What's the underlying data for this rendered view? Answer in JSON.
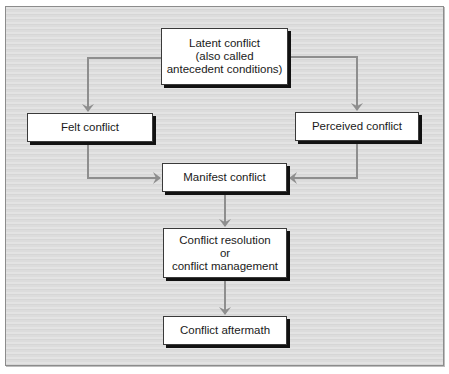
{
  "diagram": {
    "type": "flowchart",
    "nodes": {
      "latent": {
        "lines": [
          "Latent conflict",
          "(also called",
          "antecedent conditions)"
        ]
      },
      "felt": {
        "lines": [
          "Felt conflict"
        ]
      },
      "perceived": {
        "lines": [
          "Perceived conflict"
        ]
      },
      "manifest": {
        "lines": [
          "Manifest conflict"
        ]
      },
      "resolution": {
        "lines": [
          "Conflict resolution",
          "or",
          "conflict management"
        ]
      },
      "aftermath": {
        "lines": [
          "Conflict aftermath"
        ]
      }
    },
    "edges": [
      {
        "from": "Latent conflict",
        "to": "Felt conflict"
      },
      {
        "from": "Latent conflict",
        "to": "Perceived conflict"
      },
      {
        "from": "Felt conflict",
        "to": "Manifest conflict"
      },
      {
        "from": "Perceived conflict",
        "to": "Manifest conflict"
      },
      {
        "from": "Manifest conflict",
        "to": "Conflict resolution or conflict management"
      },
      {
        "from": "Conflict resolution or conflict management",
        "to": "Conflict aftermath"
      }
    ],
    "colors": {
      "connector": "#8e8e8e",
      "node_fill": "#ffffff",
      "node_shadow": "#111111",
      "background": "#dedede"
    }
  }
}
